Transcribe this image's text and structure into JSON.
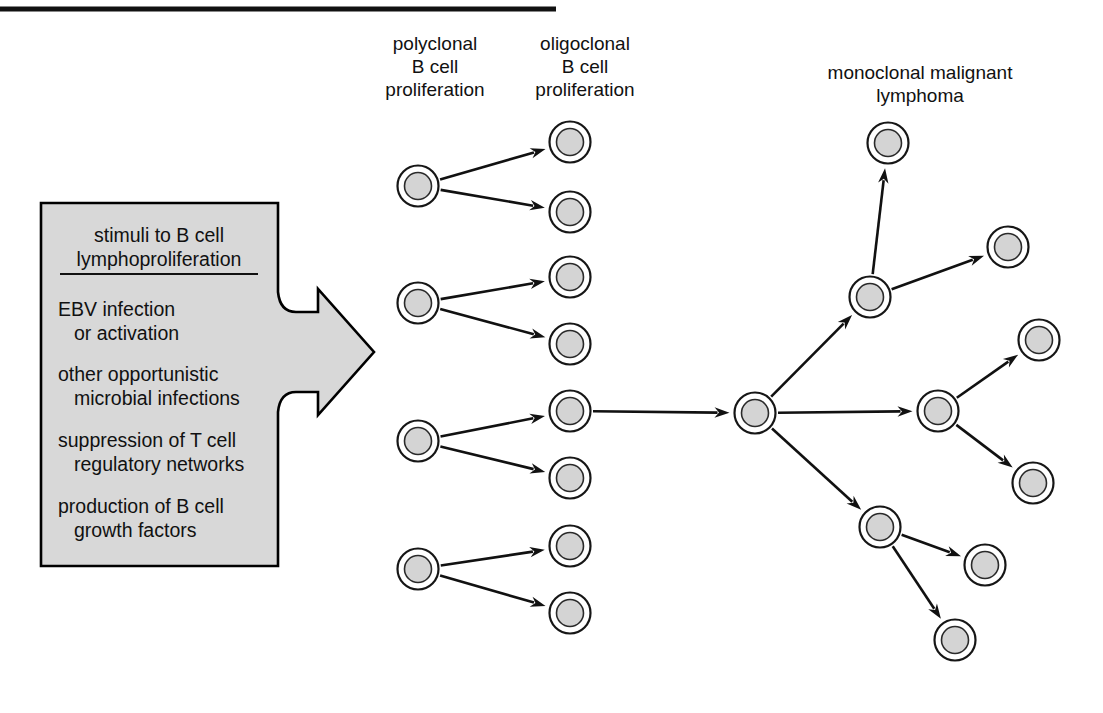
{
  "figure": {
    "background_color": "#ffffff",
    "rule_color": "#111111",
    "cell_fill_color": "#d4d4d4",
    "cell_outline_color": "#161616",
    "box_fill_color": "#d8d8d8",
    "box_border_color": "#000000",
    "arrow_color": "#111111"
  },
  "labels": {
    "polyclonal": {
      "line1": "polyclonal",
      "line2": "B cell",
      "line3": "proliferation"
    },
    "oligoclonal": {
      "line1": "oligoclonal",
      "line2": "B cell",
      "line3": "proliferation"
    },
    "monoclonal": {
      "line1": "monoclonal malignant",
      "line2": "lymphoma"
    }
  },
  "stimuli_box": {
    "heading_line1": "stimuli to B cell",
    "heading_line2": "lymphoproliferation",
    "items": [
      {
        "line1": "EBV infection",
        "line2": "or activation"
      },
      {
        "line1": "other opportunistic",
        "line2": "microbial infections"
      },
      {
        "line1": "suppression of T cell",
        "line2": "regulatory networks"
      },
      {
        "line1": "production of B cell",
        "line2": "growth factors"
      }
    ]
  },
  "chart_data": {
    "type": "diagram",
    "stages": [
      {
        "name": "polyclonal B cell proliferation",
        "cell_count": 4
      },
      {
        "name": "oligoclonal B cell proliferation",
        "cell_count": 8
      },
      {
        "name": "single expanded clone",
        "cell_count": 1
      },
      {
        "name": "monoclonal malignant lymphoma",
        "cell_count": 9
      }
    ],
    "cells": {
      "polyclonal": [
        {
          "id": "p1",
          "cx": 418,
          "cy": 186
        },
        {
          "id": "p2",
          "cx": 418,
          "cy": 303
        },
        {
          "id": "p3",
          "cx": 418,
          "cy": 441
        },
        {
          "id": "p4",
          "cx": 418,
          "cy": 569
        }
      ],
      "oligoclonal": [
        {
          "id": "o1",
          "cx": 570,
          "cy": 142
        },
        {
          "id": "o2",
          "cx": 570,
          "cy": 212
        },
        {
          "id": "o3",
          "cx": 570,
          "cy": 277
        },
        {
          "id": "o4",
          "cx": 570,
          "cy": 344
        },
        {
          "id": "o5",
          "cx": 570,
          "cy": 411
        },
        {
          "id": "o6",
          "cx": 570,
          "cy": 478
        },
        {
          "id": "o7",
          "cx": 570,
          "cy": 546
        },
        {
          "id": "o8",
          "cx": 570,
          "cy": 613
        }
      ],
      "hub": [
        {
          "id": "h1",
          "cx": 755,
          "cy": 413
        }
      ],
      "branch": [
        {
          "id": "b1",
          "cx": 870,
          "cy": 297
        },
        {
          "id": "b2",
          "cx": 938,
          "cy": 411
        },
        {
          "id": "b3",
          "cx": 880,
          "cy": 527
        }
      ],
      "terminal": [
        {
          "id": "t1",
          "cx": 888,
          "cy": 143
        },
        {
          "id": "t2",
          "cx": 1008,
          "cy": 247
        },
        {
          "id": "t3",
          "cx": 1039,
          "cy": 340
        },
        {
          "id": "t4",
          "cx": 1033,
          "cy": 483
        },
        {
          "id": "t5",
          "cx": 985,
          "cy": 565
        },
        {
          "id": "t6",
          "cx": 955,
          "cy": 640
        }
      ]
    },
    "arrows": [
      {
        "from": "p1",
        "to": "o1"
      },
      {
        "from": "p1",
        "to": "o2"
      },
      {
        "from": "p2",
        "to": "o3"
      },
      {
        "from": "p2",
        "to": "o4"
      },
      {
        "from": "p3",
        "to": "o5"
      },
      {
        "from": "p3",
        "to": "o6"
      },
      {
        "from": "p4",
        "to": "o7"
      },
      {
        "from": "p4",
        "to": "o8"
      },
      {
        "from": "o5",
        "to": "h1"
      },
      {
        "from": "h1",
        "to": "b1"
      },
      {
        "from": "h1",
        "to": "b2"
      },
      {
        "from": "h1",
        "to": "b3"
      },
      {
        "from": "b1",
        "to": "t1"
      },
      {
        "from": "b1",
        "to": "t2"
      },
      {
        "from": "b2",
        "to": "t3"
      },
      {
        "from": "b2",
        "to": "t4"
      },
      {
        "from": "b3",
        "to": "t5"
      },
      {
        "from": "b3",
        "to": "t6"
      }
    ],
    "annotations": [
      "polyclonal B cell proliferation",
      "oligoclonal B cell proliferation",
      "monoclonal malignant lymphoma",
      "stimuli to B cell lymphoproliferation"
    ]
  }
}
